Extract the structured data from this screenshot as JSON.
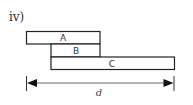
{
  "figure": {
    "label": "iv)",
    "blocks": [
      {
        "id": "A",
        "label": "A"
      },
      {
        "id": "B",
        "label": "B"
      },
      {
        "id": "C",
        "label": "C"
      }
    ],
    "dimension": {
      "label": "d",
      "line_color": "#9a9a9a",
      "arrow_color": "#111111"
    },
    "colors": {
      "stroke": "#222222",
      "fill": "#ffffff"
    }
  }
}
